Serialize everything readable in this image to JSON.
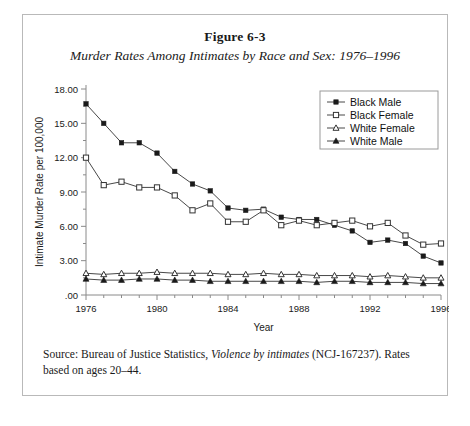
{
  "figure": {
    "number": "Figure 6-3",
    "title": "Murder Rates Among Intimates by Race and Sex: 1976–1996"
  },
  "source": {
    "prefix": "Source: Bureau of Justice Statistics, ",
    "italic_title": "Violence by intimates",
    "suffix": " (NCJ-167237). Rates based on ages 20–44."
  },
  "chart_data": {
    "type": "line",
    "title": "Murder Rates Among Intimates by Race and Sex: 1976–1996",
    "xlabel": "Year",
    "ylabel": "Intimate Murder Rate per 100,000",
    "xlim": [
      1976,
      1996
    ],
    "ylim": [
      0,
      18
    ],
    "ytick_labels": [
      ".00",
      "3.00",
      "6.00",
      "9.00",
      "12.00",
      "15.00",
      "18.00"
    ],
    "ytick_values": [
      0,
      3,
      6,
      9,
      12,
      15,
      18
    ],
    "xtick_labels": [
      "1976",
      "1980",
      "1984",
      "1988",
      "1992",
      "1996"
    ],
    "xtick_values": [
      1976,
      1980,
      1984,
      1988,
      1992,
      1996
    ],
    "grid": false,
    "legend_position": "top-right",
    "x": [
      1976,
      1977,
      1978,
      1979,
      1980,
      1981,
      1982,
      1983,
      1984,
      1985,
      1986,
      1987,
      1988,
      1989,
      1990,
      1991,
      1992,
      1993,
      1994,
      1995,
      1996
    ],
    "series": [
      {
        "name": "Black Male",
        "marker": "filled-square",
        "values": [
          16.7,
          15.0,
          13.3,
          13.3,
          12.4,
          10.8,
          9.7,
          9.1,
          7.6,
          7.4,
          7.5,
          6.8,
          6.6,
          6.6,
          6.1,
          5.6,
          4.6,
          4.8,
          4.5,
          3.4,
          2.8
        ]
      },
      {
        "name": "Black Female",
        "marker": "open-square",
        "values": [
          12.0,
          9.6,
          9.9,
          9.4,
          9.4,
          8.7,
          7.4,
          8.0,
          6.4,
          6.4,
          7.4,
          6.1,
          6.5,
          6.1,
          6.3,
          6.5,
          6.0,
          6.3,
          5.2,
          4.4,
          4.5
        ]
      },
      {
        "name": "White Female",
        "marker": "open-triangle",
        "values": [
          1.9,
          1.8,
          1.9,
          1.9,
          2.0,
          1.9,
          1.9,
          1.9,
          1.8,
          1.8,
          1.9,
          1.8,
          1.8,
          1.7,
          1.7,
          1.7,
          1.6,
          1.7,
          1.6,
          1.5,
          1.5
        ]
      },
      {
        "name": "White Male",
        "marker": "filled-triangle",
        "values": [
          1.4,
          1.3,
          1.3,
          1.4,
          1.4,
          1.3,
          1.3,
          1.2,
          1.2,
          1.2,
          1.2,
          1.2,
          1.2,
          1.1,
          1.2,
          1.2,
          1.1,
          1.1,
          1.1,
          1.0,
          1.0
        ]
      }
    ]
  },
  "colors": {
    "line": "#333333",
    "axis": "#8a8a8a",
    "border": "#b9b9b9",
    "text": "#1a1a1a"
  }
}
